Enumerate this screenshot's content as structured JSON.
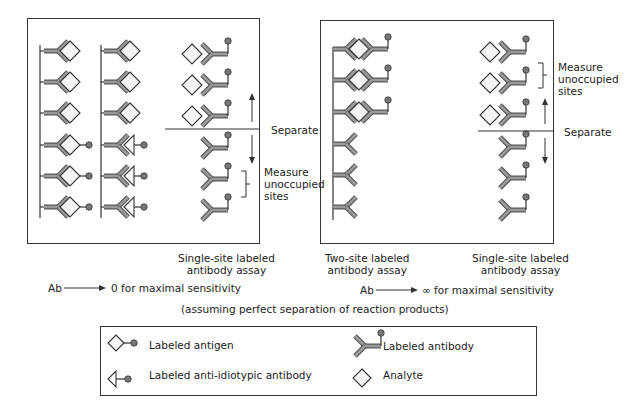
{
  "figure": {
    "left_panel": {
      "separate_label": "Separate",
      "measure_label": "Measure\nunoccupied\nsites",
      "assay_caption": "Single-site labeled\nantibody assay",
      "columns": [
        {
          "name": "antigen-bound-column",
          "rows": [
            "antibody+analyte",
            "antibody+analyte",
            "antibody+analyte",
            "antibody+labeled-antigen",
            "antibody+labeled-antigen",
            "antibody+labeled-antigen"
          ]
        },
        {
          "name": "anti-idiotypic-column",
          "rows": [
            "antibody+analyte",
            "antibody+analyte",
            "antibody+analyte",
            "antibody+anti-idiotypic",
            "antibody+anti-idiotypic",
            "antibody+anti-idiotypic"
          ]
        },
        {
          "name": "labeled-antibody-column",
          "rows": [
            "analyte+labeled-antibody",
            "analyte+labeled-antibody",
            "analyte+labeled-antibody",
            "labeled-antibody",
            "labeled-antibody",
            "labeled-antibody"
          ]
        }
      ]
    },
    "right_panel": {
      "separate_label": "Separate",
      "measure_label": "Measure\nunoccupied\nsites",
      "two_site_caption": "Two-site labeled\nantibody assay",
      "single_site_caption": "Single-site labeled\nantibody assay"
    },
    "left_sensitivity": "Ab ——▸ 0 for maximal sensitivity",
    "right_sensitivity": "Ab ——▸ ∞ for maximal sensitivity",
    "ab_left": "Ab",
    "ab_right": "Ab",
    "left_rule": "0 for maximal sensitivity",
    "right_rule": "∞ for maximal sensitivity",
    "assumption_note": "(assuming perfect separation of reaction products)"
  },
  "legend": {
    "items": [
      {
        "icon": "labeled-antigen-icon",
        "label": "Labeled antigen"
      },
      {
        "icon": "labeled-antibody-icon",
        "label": "Labeled antibody"
      },
      {
        "icon": "labeled-anti-idiotypic-antibody-icon",
        "label": "Labeled anti-idiotypic antibody"
      },
      {
        "icon": "analyte-icon",
        "label": "Analyte"
      }
    ]
  },
  "colors": {
    "line": "#333333",
    "antibody_fill": "#9a9a9a",
    "antibody_stroke": "#555555",
    "analyte_fill": "#f4f4f4",
    "label_ball": "#777777"
  }
}
